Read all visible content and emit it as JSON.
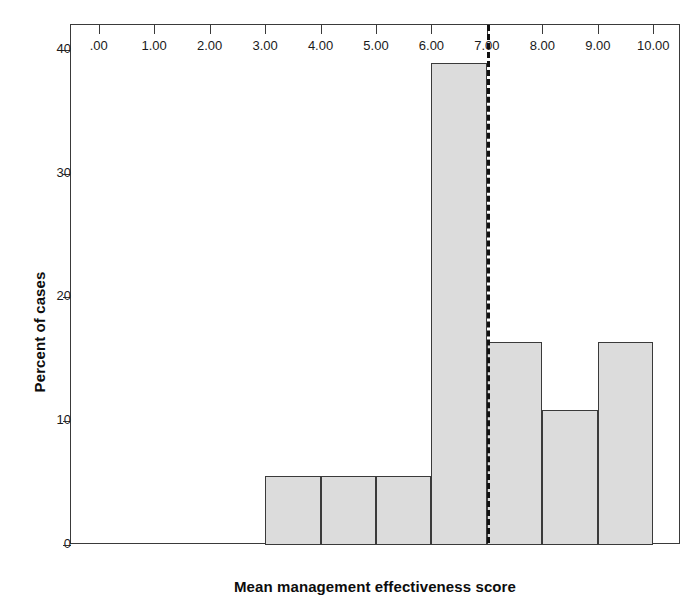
{
  "chart_data": {
    "type": "bar",
    "title": "",
    "subtitle": "",
    "xlabel": "Mean management effectiveness score",
    "ylabel": "Percent of cases",
    "xlim": [
      -0.5,
      10.5
    ],
    "ylim": [
      0,
      42
    ],
    "grid": false,
    "legend": null,
    "x_tick_labels": [
      ".00",
      "1.00",
      "2.00",
      "3.00",
      "4.00",
      "5.00",
      "6.00",
      "7.00",
      "8.00",
      "9.00",
      "10.00"
    ],
    "x_tick_values": [
      0,
      1,
      2,
      3,
      4,
      5,
      6,
      7,
      8,
      9,
      10
    ],
    "y_tick_labels": [
      "0",
      "10",
      "20",
      "30",
      "40"
    ],
    "y_tick_values": [
      0,
      10,
      20,
      30,
      40
    ],
    "bin_width": 1,
    "bins": [
      {
        "label": "3.00-4.00",
        "x0": 3,
        "x1": 4,
        "value": 5.6
      },
      {
        "label": "4.00-5.00",
        "x0": 4,
        "x1": 5,
        "value": 5.6
      },
      {
        "label": "5.00-6.00",
        "x0": 5,
        "x1": 6,
        "value": 5.6
      },
      {
        "label": "6.00-7.00",
        "x0": 6,
        "x1": 7,
        "value": 38.9
      },
      {
        "label": "7.00-8.00",
        "x0": 7,
        "x1": 8,
        "value": 16.4
      },
      {
        "label": "8.00-9.00",
        "x0": 8,
        "x1": 9,
        "value": 10.9
      },
      {
        "label": "9.00-10.00",
        "x0": 9,
        "x1": 10,
        "value": 16.4
      }
    ],
    "categories": [
      "3.00-4.00",
      "4.00-5.00",
      "5.00-6.00",
      "6.00-7.00",
      "7.00-8.00",
      "8.00-9.00",
      "9.00-10.00"
    ],
    "values": [
      5.6,
      5.6,
      5.6,
      38.9,
      16.4,
      10.9,
      16.4
    ],
    "annotations": [
      {
        "type": "vertical-reference-line",
        "x": 7.0,
        "style": "dashed",
        "color": "#111111"
      }
    ],
    "colors": {
      "bar_fill": "#dcdcdc",
      "bar_stroke": "#3a3a3a",
      "axis": "#3a3a3a",
      "text": "#0d0d0d",
      "reference_line": "#111111",
      "background": "#ffffff"
    }
  }
}
